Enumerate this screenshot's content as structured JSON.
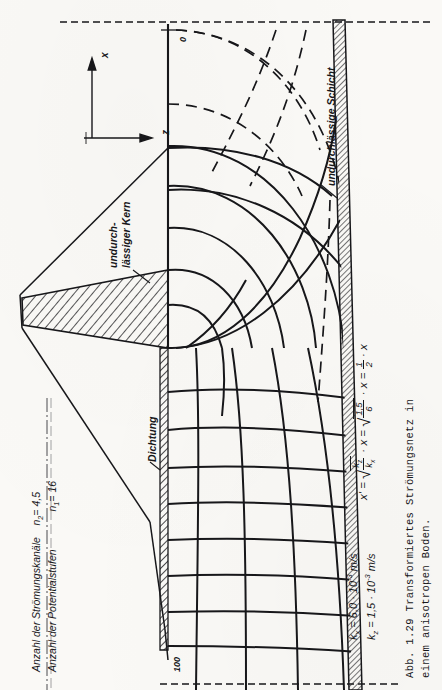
{
  "figure": {
    "caption_line1": "Abb. 1.29  Transformiertes Strömungsnetz in",
    "caption_line2": "einem anisotropen Boden.",
    "axes": {
      "x_label": "x",
      "z_label": "z"
    },
    "annotations": {
      "impermeable_core_line1": "undurch-",
      "impermeable_core_line2": "lässiger Kern",
      "sealing": "Dichtung",
      "impermeable_layer": "undurchlässige Schicht"
    },
    "head_labels": {
      "top": "0",
      "bottom": "100"
    },
    "parameters": [
      {
        "symbol": "k",
        "subscript": "x",
        "equals": "=",
        "value": "6,0 · 10",
        "exponent": "-3",
        "unit": "m/s"
      },
      {
        "symbol": "k",
        "subscript": "z",
        "equals": "=",
        "value": "1,5 · 10",
        "exponent": "-3",
        "unit": "m/s"
      }
    ],
    "counts": [
      {
        "label": "Anzahl der Strömungskanäle",
        "symbol": "n",
        "subscript": "2",
        "equals": "=",
        "value": "4,5"
      },
      {
        "label": "Anzahl der Potentialstufen",
        "symbol": "n",
        "subscript": "1",
        "equals": "=",
        "value": "16"
      }
    ],
    "transform_formula": {
      "lhs": "x'",
      "eq1": "=",
      "radicand1_num": "k",
      "radicand1_num_sub": "z",
      "radicand1_den": "k",
      "radicand1_den_sub": "x",
      "mult1": "· x",
      "eq2": "=",
      "radicand2_num": "1,5",
      "radicand2_den": "6",
      "mult2": "· x",
      "eq3": "=",
      "result_num": "1",
      "result_den": "2",
      "mult3": "· x"
    }
  },
  "colors": {
    "ink": "#17171a",
    "paper": "#faf9f6",
    "hatch": "#2a2a2e"
  }
}
